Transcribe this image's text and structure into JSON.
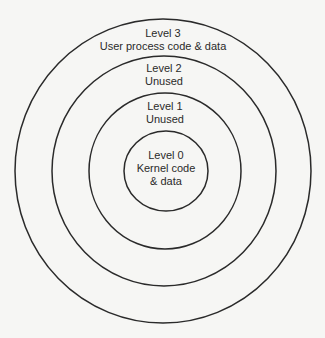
{
  "diagram": {
    "colors": {
      "background": "#f6f6f4",
      "stroke": "#2a2a2a"
    },
    "rings": [
      {
        "level_label": "Level 3",
        "description": "User process code & data"
      },
      {
        "level_label": "Level 2",
        "description": "Unused"
      },
      {
        "level_label": "Level 1",
        "description": "Unused"
      },
      {
        "level_label": "Level 0",
        "description_line1": "Kernel code",
        "description_line2": "& data"
      }
    ]
  }
}
